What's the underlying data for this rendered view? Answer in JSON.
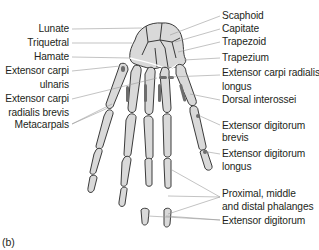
{
  "figure": {
    "caption": "(b)",
    "colors": {
      "bone_fill": "#d9d9d9",
      "bone_outline": "#3a3a3a",
      "tendon": "#6d6d6d",
      "leader_line": "#9a9a9a",
      "text": "#231f20"
    },
    "labels_left": [
      {
        "id": "lunate",
        "lines": [
          "Lunate"
        ]
      },
      {
        "id": "triquetral",
        "lines": [
          "Triquetral"
        ]
      },
      {
        "id": "hamate",
        "lines": [
          "Hamate"
        ]
      },
      {
        "id": "extensor-carpi-ulnaris",
        "lines": [
          "Extensor carpi",
          "ulnaris"
        ]
      },
      {
        "id": "extensor-carpi-radialis-brevis",
        "lines": [
          "Extensor carpi",
          "radialis brevis"
        ]
      },
      {
        "id": "metacarpals",
        "lines": [
          "Metacarpals"
        ]
      }
    ],
    "labels_right": [
      {
        "id": "scaphoid",
        "lines": [
          "Scaphoid"
        ]
      },
      {
        "id": "capitate",
        "lines": [
          "Capitate"
        ]
      },
      {
        "id": "trapezoid",
        "lines": [
          "Trapezoid"
        ]
      },
      {
        "id": "trapezium",
        "lines": [
          "Trapezium"
        ]
      },
      {
        "id": "extensor-carpi-radialis-longus",
        "lines": [
          "Extensor carpi radialis",
          "longus"
        ]
      },
      {
        "id": "dorsal-interossei",
        "lines": [
          "Dorsal interossei"
        ]
      },
      {
        "id": "extensor-digitorum-brevis",
        "lines": [
          "Extensor digitorum",
          "brevis"
        ]
      },
      {
        "id": "extensor-digitorum-longus",
        "lines": [
          "Extensor digitorum",
          "longus"
        ]
      },
      {
        "id": "phalanges",
        "lines": [
          "Proximal, middle",
          "and distal phalanges"
        ]
      },
      {
        "id": "extensor-digitorum",
        "lines": [
          "Extensor digitorum"
        ]
      }
    ]
  }
}
